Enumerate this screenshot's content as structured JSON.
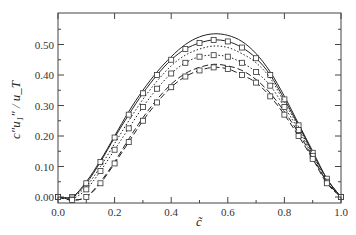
{
  "chart_data": {
    "type": "line",
    "title": "",
    "xlabel": "c̃",
    "ylabel": "c″u₁″ / u_T",
    "xlim": [
      0.0,
      1.0
    ],
    "ylim": [
      -0.02,
      0.6
    ],
    "grid": false,
    "legend": "none",
    "x_ticks": [
      0.0,
      0.2,
      0.4,
      0.6,
      0.8,
      1.0
    ],
    "x_tick_labels": [
      "0.0",
      "0.2",
      "0.4",
      "0.6",
      "0.8",
      "1.0"
    ],
    "y_ticks": [
      0.0,
      0.1,
      0.2,
      0.3,
      0.4,
      0.5
    ],
    "y_tick_labels": [
      "0.00",
      "0.10",
      "0.20",
      "0.30",
      "0.40",
      "0.50"
    ],
    "x": [
      0.0,
      0.05,
      0.1,
      0.15,
      0.2,
      0.25,
      0.3,
      0.35,
      0.4,
      0.45,
      0.5,
      0.55,
      0.6,
      0.65,
      0.7,
      0.75,
      0.8,
      0.85,
      0.9,
      0.95,
      1.0
    ],
    "series": [
      {
        "name": "solid",
        "style": "solid",
        "markers": false,
        "values": [
          0.0,
          0.0,
          0.05,
          0.12,
          0.2,
          0.28,
          0.35,
          0.41,
          0.46,
          0.5,
          0.525,
          0.535,
          0.53,
          0.51,
          0.47,
          0.41,
          0.33,
          0.24,
          0.15,
          0.06,
          0.0
        ]
      },
      {
        "name": "solid-squares",
        "style": "solid",
        "markers": true,
        "values": [
          0.0,
          0.0,
          0.045,
          0.115,
          0.195,
          0.27,
          0.34,
          0.4,
          0.45,
          0.485,
          0.505,
          0.515,
          0.51,
          0.49,
          0.455,
          0.4,
          0.32,
          0.235,
          0.145,
          0.06,
          0.0
        ]
      },
      {
        "name": "dotted",
        "style": "dotted",
        "markers": false,
        "values": [
          0.0,
          0.0,
          0.035,
          0.1,
          0.175,
          0.25,
          0.32,
          0.38,
          0.43,
          0.465,
          0.485,
          0.495,
          0.49,
          0.47,
          0.44,
          0.39,
          0.31,
          0.23,
          0.14,
          0.055,
          0.0
        ]
      },
      {
        "name": "dotted-squares",
        "style": "dotted",
        "markers": true,
        "values": [
          0.0,
          -0.005,
          0.025,
          0.085,
          0.155,
          0.225,
          0.295,
          0.355,
          0.405,
          0.44,
          0.46,
          0.465,
          0.46,
          0.44,
          0.41,
          0.365,
          0.295,
          0.22,
          0.135,
          0.05,
          0.0
        ]
      },
      {
        "name": "dashed",
        "style": "dashed",
        "markers": false,
        "values": [
          0.0,
          -0.01,
          0.0,
          0.05,
          0.115,
          0.19,
          0.26,
          0.32,
          0.37,
          0.405,
          0.425,
          0.435,
          0.43,
          0.415,
          0.385,
          0.34,
          0.28,
          0.21,
          0.13,
          0.05,
          0.0
        ]
      },
      {
        "name": "dashed-squares",
        "style": "dashed",
        "markers": true,
        "values": [
          0.0,
          -0.01,
          0.0,
          0.045,
          0.11,
          0.18,
          0.25,
          0.31,
          0.36,
          0.395,
          0.415,
          0.425,
          0.42,
          0.4,
          0.375,
          0.33,
          0.27,
          0.2,
          0.125,
          0.045,
          0.0
        ]
      }
    ]
  }
}
